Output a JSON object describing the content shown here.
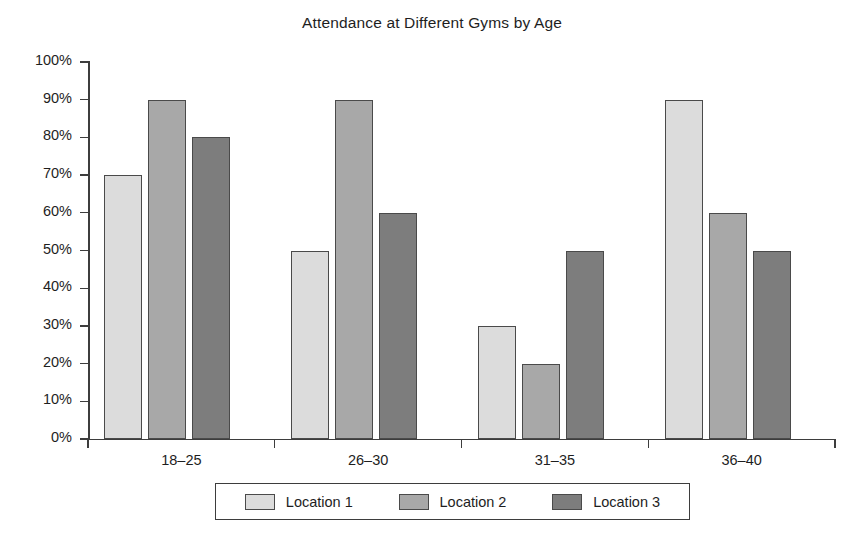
{
  "chart_data": {
    "type": "bar",
    "title": "Attendance at Different Gyms by Age",
    "xlabel": "",
    "ylabel": "",
    "categories": [
      "18–25",
      "26–30",
      "31–35",
      "36–40"
    ],
    "series": [
      {
        "name": "Location 1",
        "color": "#dcdcdc",
        "values": [
          70,
          50,
          30,
          90
        ]
      },
      {
        "name": "Location 2",
        "color": "#a8a8a8",
        "values": [
          90,
          90,
          20,
          60
        ]
      },
      {
        "name": "Location 3",
        "color": "#7d7d7d",
        "values": [
          80,
          60,
          50,
          50
        ]
      }
    ],
    "ylim": [
      0,
      100
    ],
    "y_tick_values": [
      0,
      10,
      20,
      30,
      40,
      50,
      60,
      70,
      80,
      90,
      100
    ],
    "y_tick_labels": [
      "0%",
      "10%",
      "20%",
      "30%",
      "40%",
      "50%",
      "60%",
      "70%",
      "80%",
      "90%",
      "100%"
    ],
    "grid": false,
    "legend_position": "bottom",
    "value_suffix": "%"
  },
  "legend": {
    "entries": [
      {
        "label": "Location 1",
        "color": "#dcdcdc"
      },
      {
        "label": "Location 2",
        "color": "#a8a8a8"
      },
      {
        "label": "Location 3",
        "color": "#7d7d7d"
      }
    ]
  },
  "axis_colors": {
    "line": "#3d3d3d",
    "text": "#1e1e1e",
    "bar_border": "#4a4a4a"
  }
}
